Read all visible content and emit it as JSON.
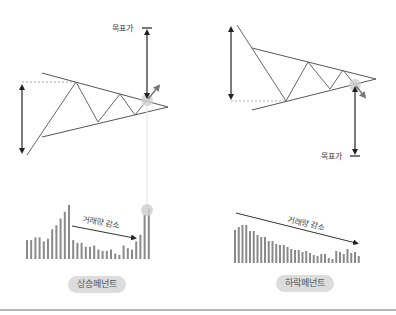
{
  "diagram": {
    "colors": {
      "line": "#555555",
      "arrow": "#333333",
      "breakout_arrow": "#777777",
      "dashed": "#999999",
      "bar": "#8a8a8a",
      "highlight": "#cfcfcf",
      "pill_bg": "#dcdcdc",
      "divider": "#b5b5b5"
    },
    "left_panel": {
      "name": "ascending-pennant",
      "target_label": "목표가",
      "volume_label": "거래량 감소",
      "pattern_label": "상승페넌트",
      "volume_bars": [
        14,
        14,
        16,
        16,
        13,
        15,
        22,
        25,
        30,
        35,
        40,
        14,
        12,
        12,
        9,
        9,
        10,
        7,
        6,
        6,
        7,
        4,
        3,
        10,
        8,
        7,
        13,
        18,
        33,
        38
      ]
    },
    "right_panel": {
      "name": "descending-pennant",
      "target_label": "목표가",
      "volume_label": "거래량 감소",
      "pattern_label": "하락페넌트",
      "volume_bars": [
        33,
        36,
        38,
        38,
        32,
        32,
        28,
        26,
        26,
        22,
        22,
        19,
        18,
        18,
        16,
        14,
        13,
        13,
        11,
        12,
        10,
        8,
        7,
        9,
        9,
        5,
        4,
        12,
        11,
        9,
        14,
        10,
        11,
        7
      ]
    }
  }
}
